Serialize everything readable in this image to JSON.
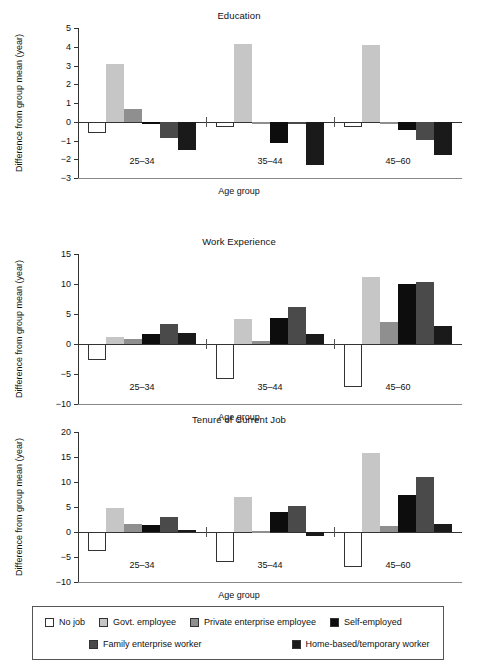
{
  "figure": {
    "xlabel": "Age group",
    "ylabel": "Difference from group mean (year)",
    "groups": [
      "25–34",
      "35–44",
      "45–60"
    ]
  },
  "legend": {
    "items": [
      {
        "label": "No job",
        "color": "#ffffff"
      },
      {
        "label": "Govt. employee",
        "color": "#c6c6c6"
      },
      {
        "label": "Private enterprise employee",
        "color": "#8f8f8f"
      },
      {
        "label": "Self-employed",
        "color": "#0d0d0d"
      },
      {
        "label": "Family enterprise worker",
        "color": "#4a4a4a"
      },
      {
        "label": "Home-based/temporary worker",
        "color": "#1a1a1a"
      }
    ]
  },
  "chart_data": [
    {
      "type": "bar",
      "title": "Education",
      "xlabel": "Age group",
      "ylabel": "Difference from group mean (year)",
      "categories": [
        "25–34",
        "35–44",
        "45–60"
      ],
      "ylim": [
        -3,
        5
      ],
      "yticks": [
        5,
        4,
        3,
        2,
        1,
        0,
        -1,
        -2,
        -3
      ],
      "ytick_labels": [
        "5",
        "4",
        "3",
        "2",
        "1",
        "0",
        "−1",
        "−2",
        "−3"
      ],
      "grid": false,
      "legend_position": "bottom",
      "series": [
        {
          "name": "No job",
          "values": [
            -0.6,
            -0.3,
            -0.3
          ]
        },
        {
          "name": "Govt. employee",
          "values": [
            3.1,
            4.15,
            4.1
          ]
        },
        {
          "name": "Private enterprise employee",
          "values": [
            0.7,
            -0.05,
            -0.05
          ]
        },
        {
          "name": "Self-employed",
          "values": [
            -0.05,
            -1.15,
            -0.45
          ]
        },
        {
          "name": "Family enterprise worker",
          "values": [
            -0.85,
            -0.1,
            -0.95
          ]
        },
        {
          "name": "Home-based/temporary worker",
          "values": [
            -1.5,
            -2.3,
            -1.75
          ]
        }
      ]
    },
    {
      "type": "bar",
      "title": "Work Experience",
      "xlabel": "Age group",
      "ylabel": "Difference from group mean (year)",
      "categories": [
        "25–34",
        "35–44",
        "45–60"
      ],
      "ylim": [
        -10,
        15
      ],
      "yticks": [
        15,
        10,
        5,
        0,
        -5,
        -10
      ],
      "ytick_labels": [
        "15",
        "10",
        "5",
        "0",
        "−5",
        "−10"
      ],
      "grid": false,
      "legend_position": "bottom",
      "series": [
        {
          "name": "No job",
          "values": [
            -2.6,
            -5.9,
            -7.2
          ]
        },
        {
          "name": "Govt. employee",
          "values": [
            1.1,
            4.1,
            11.1
          ]
        },
        {
          "name": "Private enterprise employee",
          "values": [
            0.9,
            0.5,
            3.7
          ]
        },
        {
          "name": "Self-employed",
          "values": [
            1.7,
            4.3,
            10.0
          ]
        },
        {
          "name": "Family enterprise worker",
          "values": [
            3.4,
            6.2,
            10.4
          ]
        },
        {
          "name": "Home-based/temporary worker",
          "values": [
            1.9,
            1.6,
            3.0
          ]
        }
      ]
    },
    {
      "type": "bar",
      "title": "Tenure of Current Job",
      "xlabel": "Age group",
      "ylabel": "Difference from group mean (year)",
      "categories": [
        "25–34",
        "35–44",
        "45–60"
      ],
      "ylim": [
        -10,
        20
      ],
      "yticks": [
        20,
        15,
        10,
        5,
        0,
        -5,
        -10
      ],
      "ytick_labels": [
        "20",
        "15",
        "10",
        "5",
        "0",
        "−5",
        "−10"
      ],
      "grid": false,
      "legend_position": "bottom",
      "series": [
        {
          "name": "No job",
          "values": [
            -3.7,
            -5.9,
            -6.9
          ]
        },
        {
          "name": "Govt. employee",
          "values": [
            4.8,
            7.0,
            15.9
          ]
        },
        {
          "name": "Private enterprise employee",
          "values": [
            1.7,
            0.2,
            1.2
          ]
        },
        {
          "name": "Self-employed",
          "values": [
            1.5,
            4.1,
            7.4
          ]
        },
        {
          "name": "Family enterprise worker",
          "values": [
            3.1,
            5.3,
            11.0
          ]
        },
        {
          "name": "Home-based/temporary worker",
          "values": [
            0.5,
            -0.8,
            1.7
          ]
        }
      ]
    }
  ]
}
